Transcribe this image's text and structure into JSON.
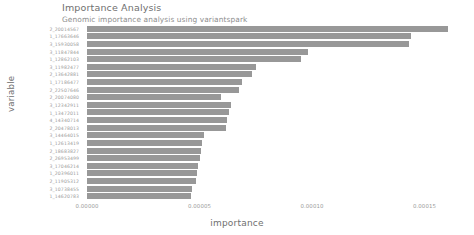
{
  "chart_data": {
    "type": "bar",
    "orientation": "horizontal",
    "title": "Importance Analysis",
    "subtitle": "Genomic importance analysis using variantspark",
    "xlabel": "importance",
    "ylabel": "variable",
    "xlim": [
      0,
      0.00016667
    ],
    "xticks": [
      0,
      5e-05,
      0.0001,
      0.00015
    ],
    "xtick_labels": [
      "0.00000",
      "0.00005",
      "0.00010",
      "0.00015"
    ],
    "grid": false,
    "legend": null,
    "bar_color": "#989898",
    "background_color": "#ffffff",
    "categories": [
      "2_20014567",
      "1_17663646",
      "3_15930058",
      "3_11847844",
      "1_12862103",
      "3_11982477",
      "2_13642881",
      "1_17186477",
      "2_22507646",
      "2_20074080",
      "3_12342911",
      "1_13472011",
      "4_14340714",
      "2_20478013",
      "3_14464015",
      "1_12613419",
      "2_18683827",
      "2_26953499",
      "3_17046214",
      "1_20396011",
      "2_11905312",
      "3_10738455",
      "1_14620783"
    ],
    "values": [
      0.0001605,
      0.0001438,
      0.0001433,
      9.836e-05,
      9.527e-05,
      7.498e-05,
      7.322e-05,
      6.881e-05,
      6.748e-05,
      5.955e-05,
      6.395e-05,
      6.306e-05,
      6.218e-05,
      6.174e-05,
      5.203e-05,
      5.115e-05,
      5.071e-05,
      5.027e-05,
      4.939e-05,
      4.895e-05,
      4.851e-05,
      4.674e-05,
      4.63e-05
    ]
  }
}
